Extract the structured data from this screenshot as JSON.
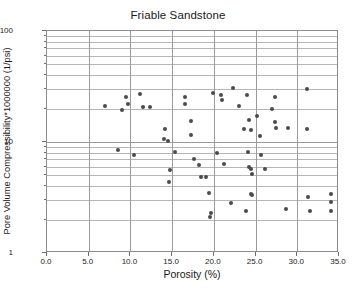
{
  "chart": {
    "title": "Friable Sandstone",
    "xlabel": "Porosity (%)",
    "ylabel": "Pore Volume Compressibility*1000000 (1/psi)"
  },
  "chart_data": {
    "type": "scatter",
    "title": "Friable Sandstone",
    "xlabel": "Porosity (%)",
    "ylabel": "Pore Volume Compressibility*1000000 (1/psi)",
    "xlim": [
      0.0,
      35.0
    ],
    "ylim": [
      1,
      100
    ],
    "yscale": "log",
    "xscale": "linear",
    "xticks": [
      "0.0",
      "5.0",
      "10.0",
      "15.0",
      "20.0",
      "25.0",
      "30.0",
      "35.0"
    ],
    "xtick_values": [
      0.0,
      5.0,
      10.0,
      15.0,
      20.0,
      25.0,
      30.0,
      35.0
    ],
    "yticks": [
      "1",
      "10",
      "100"
    ],
    "ytick_values": [
      1,
      10,
      100
    ],
    "grid": true,
    "grid_axes": "both",
    "legend": null,
    "marker": {
      "shape": "circle",
      "color": "#4a4a52",
      "size": 4
    },
    "series": [
      {
        "name": "Friable Sandstone",
        "points": [
          [
            7.0,
            21.0
          ],
          [
            9.0,
            19.6
          ],
          [
            9.5,
            25.5
          ],
          [
            9.7,
            21.8
          ],
          [
            11.2,
            27.1
          ],
          [
            11.5,
            20.8
          ],
          [
            12.3,
            20.8
          ],
          [
            8.5,
            8.5
          ],
          [
            10.4,
            7.6
          ],
          [
            14.2,
            13.2
          ],
          [
            14.0,
            10.6
          ],
          [
            14.5,
            10.2
          ],
          [
            14.7,
            5.6
          ],
          [
            14.6,
            4.4
          ],
          [
            15.3,
            8.2
          ],
          [
            16.5,
            25.3
          ],
          [
            16.6,
            22.1
          ],
          [
            17.3,
            15.5
          ],
          [
            17.3,
            11.6
          ],
          [
            17.6,
            7.1
          ],
          [
            18.2,
            6.2
          ],
          [
            18.5,
            4.8
          ],
          [
            19.0,
            4.8
          ],
          [
            19.4,
            3.5
          ],
          [
            19.6,
            2.3
          ],
          [
            19.5,
            2.1
          ],
          [
            19.9,
            27.5
          ],
          [
            20.9,
            26.5
          ],
          [
            21.0,
            24.0
          ],
          [
            20.4,
            8.0
          ],
          [
            21.2,
            6.4
          ],
          [
            22.1,
            2.8
          ],
          [
            22.3,
            30.5
          ],
          [
            23.0,
            21.0
          ],
          [
            24.0,
            26.5
          ],
          [
            24.2,
            15.9
          ],
          [
            23.6,
            13.0
          ],
          [
            24.5,
            12.9
          ],
          [
            24.1,
            8.2
          ],
          [
            24.2,
            5.9
          ],
          [
            24.4,
            5.7
          ],
          [
            24.6,
            5.2
          ],
          [
            24.5,
            3.4
          ],
          [
            24.6,
            3.3
          ],
          [
            23.9,
            2.4
          ],
          [
            25.2,
            17.0
          ],
          [
            25.5,
            11.3
          ],
          [
            25.6,
            7.7
          ],
          [
            26.1,
            5.7
          ],
          [
            27.3,
            25.5
          ],
          [
            27.0,
            19.8
          ],
          [
            27.3,
            15.2
          ],
          [
            27.5,
            13.4
          ],
          [
            28.9,
            13.3
          ],
          [
            28.7,
            2.5
          ],
          [
            31.2,
            29.8
          ],
          [
            31.2,
            13.0
          ],
          [
            31.3,
            3.2
          ],
          [
            31.5,
            2.4
          ],
          [
            34.0,
            3.4
          ],
          [
            34.0,
            2.9
          ],
          [
            34.1,
            2.4
          ],
          [
            16.5,
            1.0
          ]
        ]
      }
    ]
  }
}
